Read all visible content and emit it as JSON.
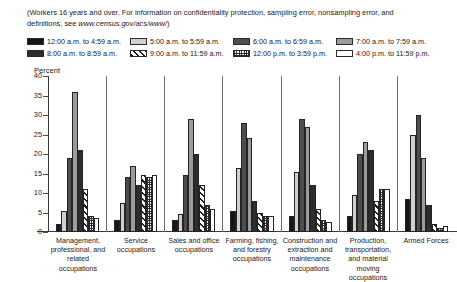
{
  "note": {
    "text_before": "(Workers 16 years and over. For information on confidentiality protection, sampling error, nonsampling error, and definitions, see ",
    "url": "www.census.gov/acs/www/",
    "text_after": ")"
  },
  "axis": {
    "ylabel": "Percent",
    "yticks": [
      "40",
      "35",
      "30",
      "25",
      "20",
      "15",
      "10",
      "5",
      "0"
    ]
  },
  "legend": [
    {
      "label": "12:00 a.m. to 4:59 a.m.",
      "fill": "f-black",
      "icon": "swatch-black"
    },
    {
      "label": "5:00 a.m. to 5:59 a.m.",
      "fill": "f-litegray",
      "icon": "swatch-light-gray"
    },
    {
      "label": "6:00 a.m. to 6:59 a.m.",
      "fill": "f-darkgray",
      "icon": "swatch-dark-gray"
    },
    {
      "label": "7:00 a.m. to 7:59 a.m.",
      "fill": "f-midgray",
      "icon": "swatch-medium-gray"
    },
    {
      "label": "8:00 a.m. to 8:59 a.m.",
      "fill": "f-deepgray",
      "icon": "swatch-deep-gray"
    },
    {
      "label": "9:00 a.m. to 11:59 a.m.",
      "fill": "f-hatch",
      "icon": "swatch-diagonal-hatch"
    },
    {
      "label": "12:00 p.m. to 3:59 p.m.",
      "fill": "f-checker",
      "icon": "swatch-checkerboard"
    },
    {
      "label": "4:00 p.m. to 11:59 p.m.",
      "fill": "f-white",
      "icon": "swatch-white"
    }
  ],
  "chart_data": {
    "type": "bar",
    "title": "",
    "subtitle": "",
    "xlabel": "",
    "ylabel": "Percent",
    "ylim": [
      0,
      40
    ],
    "ytick_step": 5,
    "grid": false,
    "legend_position": "top",
    "categories": [
      "Management, professional, and related occupations",
      "Service occupations",
      "Sales and office occupations",
      "Farming, fishing, and forestry occupations",
      "Construction and extraction and maintenance occupations",
      "Production, transportation, and material moving occupations",
      "Armed Forces"
    ],
    "series": [
      {
        "name": "12:00 a.m. to 4:59 a.m.",
        "fill": "f-black",
        "values": [
          2.0,
          3.0,
          3.0,
          5.5,
          4.0,
          4.0,
          8.5
        ]
      },
      {
        "name": "5:00 a.m. to 5:59 a.m.",
        "fill": "f-litegray",
        "values": [
          5.5,
          7.5,
          4.5,
          16.5,
          15.5,
          9.5,
          25.0
        ]
      },
      {
        "name": "6:00 a.m. to 6:59 a.m.",
        "fill": "f-darkgray",
        "values": [
          19.0,
          14.0,
          14.5,
          28.0,
          29.0,
          20.0,
          30.0
        ]
      },
      {
        "name": "7:00 a.m. to 7:59 a.m.",
        "fill": "f-midgray",
        "values": [
          36.0,
          17.0,
          29.0,
          24.0,
          27.0,
          23.0,
          19.0
        ]
      },
      {
        "name": "8:00 a.m. to 8:59 a.m.",
        "fill": "f-deepgray",
        "values": [
          21.0,
          12.0,
          20.0,
          8.0,
          12.0,
          21.0,
          7.0
        ]
      },
      {
        "name": "9:00 a.m. to 11:59 a.m.",
        "fill": "f-hatch",
        "values": [
          11.0,
          14.5,
          12.0,
          5.0,
          6.0,
          8.0,
          2.0
        ]
      },
      {
        "name": "12:00 p.m. to 3:59 p.m.",
        "fill": "f-checker",
        "values": [
          4.0,
          14.0,
          7.0,
          4.0,
          3.0,
          11.0,
          1.0
        ]
      },
      {
        "name": "4:00 p.m. to 11:59 p.m.",
        "fill": "f-white",
        "values": [
          3.5,
          14.5,
          6.0,
          4.0,
          2.5,
          11.0,
          1.5
        ]
      }
    ]
  }
}
